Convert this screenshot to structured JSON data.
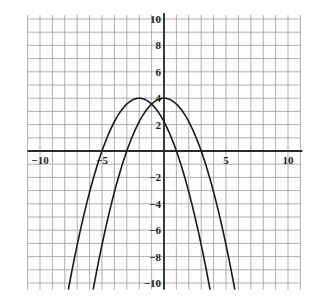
{
  "chart_data": {
    "type": "line",
    "title": "",
    "xlabel": "",
    "ylabel": "",
    "xlim": [
      -11,
      11
    ],
    "ylim": [
      -10.5,
      10.3
    ],
    "grid": true,
    "grid_step": 1,
    "x_tick_labels": [
      {
        "value": -10,
        "label": "−10"
      },
      {
        "value": -5,
        "label": "−5"
      },
      {
        "value": 5,
        "label": "5"
      },
      {
        "value": 10,
        "label": "10"
      }
    ],
    "y_tick_labels": [
      {
        "value": 10,
        "label": "10"
      },
      {
        "value": 8,
        "label": "8"
      },
      {
        "value": 6,
        "label": "6"
      },
      {
        "value": 4,
        "label": "4"
      },
      {
        "value": 2,
        "label": "2"
      },
      {
        "value": -2,
        "label": "−2"
      },
      {
        "value": -4,
        "label": "−4"
      },
      {
        "value": -6,
        "label": "−6"
      },
      {
        "value": -8,
        "label": "−8"
      },
      {
        "value": -10,
        "label": "−10"
      }
    ],
    "series": [
      {
        "name": "parabola-a",
        "description": "downward parabola, vertex (0, 4)",
        "vertex": [
          0,
          4
        ],
        "a": -0.4444,
        "x_intercepts": [
          -3,
          3
        ],
        "points": [
          [
            -5.7,
            -10.4
          ],
          [
            -5,
            -7.1
          ],
          [
            -4,
            -3.1
          ],
          [
            -3,
            0
          ],
          [
            -2,
            2.2
          ],
          [
            -1,
            3.6
          ],
          [
            0,
            4
          ],
          [
            1,
            3.6
          ],
          [
            2,
            2.2
          ],
          [
            3,
            0
          ],
          [
            4,
            -3.1
          ],
          [
            5,
            -7.1
          ],
          [
            5.7,
            -10.4
          ]
        ]
      },
      {
        "name": "parabola-b",
        "description": "downward parabola, vertex (-2, 4)",
        "vertex": [
          -2,
          4
        ],
        "a": -0.4444,
        "x_intercepts": [
          -5,
          1
        ],
        "points": [
          [
            -7.7,
            -10.4
          ],
          [
            -7,
            -7.1
          ],
          [
            -6,
            -3.1
          ],
          [
            -5,
            0
          ],
          [
            -4,
            2.2
          ],
          [
            -3,
            3.6
          ],
          [
            -2,
            4
          ],
          [
            -1,
            3.6
          ],
          [
            0,
            2.2
          ],
          [
            1,
            0
          ],
          [
            2,
            -3.1
          ],
          [
            3,
            -7.1
          ],
          [
            3.7,
            -10.4
          ]
        ]
      }
    ]
  },
  "colors": {
    "background": "#ffffff",
    "grid": "#9a9a9a",
    "axis": "#2a2a2a",
    "curve": "#1a1a1a"
  }
}
